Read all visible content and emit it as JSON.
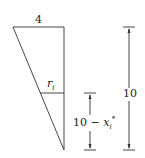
{
  "diagram": {
    "top_label": "4",
    "radius_label": "r",
    "radius_subscript": "i",
    "height_label": "10",
    "partial_height_prefix": "10 − ",
    "partial_height_var": "x",
    "partial_height_sub": "i",
    "partial_height_sup": "*",
    "colors": {
      "line": "#333333",
      "background": "#ffffff"
    }
  }
}
